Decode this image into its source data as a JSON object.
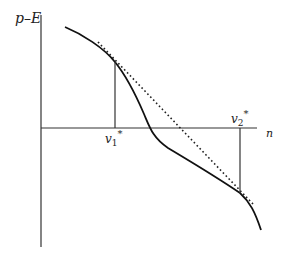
{
  "diagram": {
    "y_axis_label": "p–E",
    "x_axis_label": "n",
    "point_1_label": "v",
    "point_1_sub": "1",
    "point_1_sup": "*",
    "point_2_label": "v",
    "point_2_sub": "2",
    "point_2_sup": "*",
    "colors": {
      "axis": "#333333",
      "curve": "#111111",
      "tangent": "#222222"
    },
    "elements": {
      "curve": "solid S-shaped decreasing curve crossing the n-axis",
      "tangent_line": "dotted common tangent touching the curve at v1* and v2*",
      "drop_lines": "vertical lines from tangent points to the n-axis at v1* and v2*"
    }
  }
}
